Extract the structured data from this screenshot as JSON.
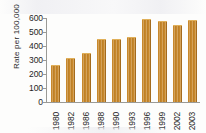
{
  "chart_data": {
    "type": "bar",
    "title": "",
    "subtitle": "",
    "xlabel": "",
    "ylabel": "Rate per 100,000",
    "categories": [
      "1980",
      "1982",
      "1986",
      "1988",
      "1990",
      "1993",
      "1996",
      "1999",
      "2002",
      "2003"
    ],
    "values": [
      260,
      305,
      340,
      445,
      443,
      458,
      585,
      568,
      545,
      578
    ],
    "ylim": [
      0,
      600
    ],
    "yticks": [
      600,
      500,
      400,
      300,
      200,
      100,
      0
    ],
    "ytick_labels": [
      "600",
      "500",
      "400",
      "300",
      "200",
      "100",
      "0"
    ],
    "grid": false,
    "legend": null,
    "bar_color": "#C8882B",
    "axis_color": "#9A9A96",
    "text_color": "#1F1F1F",
    "xtick_rotation": -90
  }
}
